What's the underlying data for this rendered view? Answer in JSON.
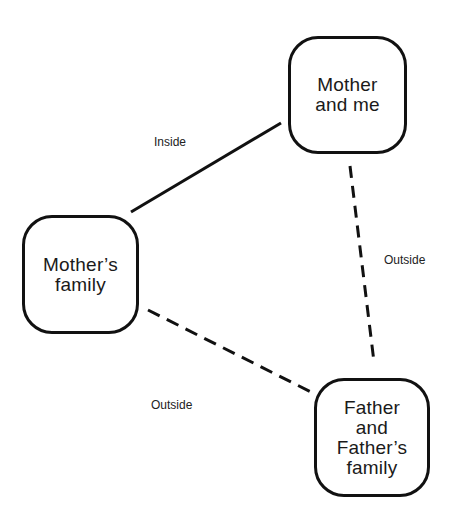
{
  "diagram": {
    "nodes": [
      {
        "id": "mother-and-me",
        "label": "Mother\nand me"
      },
      {
        "id": "mothers-family",
        "label": "Mother’s\nfamily"
      },
      {
        "id": "father-and-fathers-family",
        "label": "Father\nand\nFather’s\nfamily"
      }
    ],
    "edges": [
      {
        "from": "mothers-family",
        "to": "mother-and-me",
        "label": "Inside",
        "style": "solid"
      },
      {
        "from": "mother-and-me",
        "to": "father-and-fathers-family",
        "label": "Outside",
        "style": "dashed"
      },
      {
        "from": "mothers-family",
        "to": "father-and-fathers-family",
        "label": "Outside",
        "style": "dashed"
      }
    ],
    "colors": {
      "stroke": "#111111",
      "background": "#ffffff",
      "text": "#1a1a1a"
    }
  }
}
